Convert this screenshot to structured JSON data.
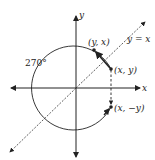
{
  "diagram": {
    "axes": {
      "x_label": "x",
      "y_label": "y"
    },
    "line_label": "y = x",
    "angle_label": "270°",
    "points": [
      {
        "id": "xy",
        "label": "(x, y)"
      },
      {
        "id": "yx",
        "label": "(y, x)"
      },
      {
        "id": "xneg",
        "label": "(x, −y)"
      }
    ],
    "colors": {
      "stroke": "#222222",
      "background": "#ffffff"
    }
  }
}
